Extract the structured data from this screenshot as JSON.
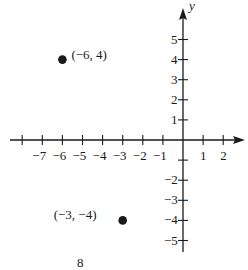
{
  "chart_data": {
    "type": "scatter",
    "title": "",
    "xlabel": "",
    "ylabel": "y",
    "xlim": [
      -8,
      3
    ],
    "ylim": [
      -5.5,
      6
    ],
    "grid": false,
    "legend": null,
    "x_ticks": [
      -8,
      -7,
      -6,
      -5,
      -4,
      -3,
      -2,
      -1,
      1,
      2
    ],
    "x_tick_labels": [
      "",
      "−7",
      "−6",
      "−5",
      "−4",
      "−3",
      "−2",
      "−1",
      "1",
      "2"
    ],
    "y_ticks": [
      5,
      4,
      3,
      2,
      1,
      -1,
      -2,
      -3,
      -4,
      -5
    ],
    "y_tick_labels": [
      "5",
      "4",
      "3",
      "2",
      "1",
      "",
      "−2",
      "−3",
      "−4",
      "−5"
    ],
    "points": [
      {
        "x": -6,
        "y": 4,
        "label": "(−6, 4)"
      },
      {
        "x": -3,
        "y": -4,
        "label": "(−3, −4)"
      }
    ],
    "annotations": [
      "8"
    ]
  },
  "page_number": "8",
  "colors": {
    "ink": "#1a1a1a",
    "background": "#ffffff"
  }
}
